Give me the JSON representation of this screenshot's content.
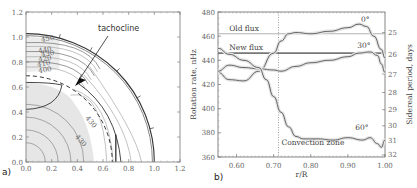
{
  "chart_data": [
    {
      "type": "contour",
      "panel_label": "a)",
      "title": "",
      "xlabel": "",
      "ylabel": "",
      "xlim": [
        0.0,
        1.2
      ],
      "ylim": [
        0.0,
        1.2
      ],
      "x_ticks": [
        "0.0",
        "0.2",
        "0.4",
        "0.6",
        "0.8",
        "1.0",
        "1.2"
      ],
      "y_ticks": [
        "0.0",
        "0.2",
        "0.4",
        "0.6",
        "0.8",
        "1.0",
        "1.2"
      ],
      "annotations": [
        {
          "text": "tachocline",
          "arrow_to": [
            0.38,
            0.6
          ]
        }
      ],
      "contour_labels": [
        "450",
        "440",
        "430",
        "420",
        "410",
        "400",
        "430",
        "430"
      ],
      "tachocline_radius": 0.7,
      "surface_radius": 1.0
    },
    {
      "type": "line",
      "panel_label": "b)",
      "title": "",
      "xlabel": "r/R",
      "ylabel": "Rotation rate, nHz",
      "ylabel_right": "Sidereal period, days",
      "xlim": [
        0.55,
        1.0
      ],
      "ylim": [
        360,
        480
      ],
      "x_ticks": [
        "0.60",
        "0.70",
        "0.80",
        "0.90",
        "1.00"
      ],
      "y_ticks": [
        "360",
        "380",
        "400",
        "420",
        "440",
        "460",
        "480"
      ],
      "y_ticks_right": [
        "24",
        "25",
        "26",
        "27",
        "28",
        "29",
        "30",
        "31",
        "32"
      ],
      "grid": false,
      "vertical_line": {
        "x": 0.713,
        "label": "Convection zone",
        "style": "dotted"
      },
      "horizontal_lines": [
        {
          "name": "Old flux",
          "y": 462
        },
        {
          "name": "New flux",
          "y": 446
        }
      ],
      "series": [
        {
          "name": "0°",
          "x": [
            0.55,
            0.58,
            0.62,
            0.66,
            0.7,
            0.72,
            0.74,
            0.76,
            0.8,
            0.85,
            0.9,
            0.93,
            0.95,
            0.97,
            0.99,
            1.0
          ],
          "y": [
            430,
            424,
            423,
            431,
            446,
            456,
            462,
            463,
            462,
            464,
            467,
            470,
            468,
            460,
            449,
            442
          ]
        },
        {
          "name": "30°",
          "x": [
            0.55,
            0.58,
            0.62,
            0.66,
            0.7,
            0.72,
            0.76,
            0.8,
            0.85,
            0.9,
            0.93,
            0.96,
            0.98,
            0.99,
            1.0
          ],
          "y": [
            431,
            436,
            434,
            433,
            432,
            431,
            435,
            438,
            440,
            443,
            446,
            447,
            444,
            437,
            430
          ]
        },
        {
          "name": "60°",
          "x": [
            0.55,
            0.58,
            0.62,
            0.66,
            0.68,
            0.7,
            0.72,
            0.74,
            0.76,
            0.78,
            0.82,
            0.86,
            0.9,
            0.94,
            0.96,
            0.98,
            0.99,
            1.0
          ],
          "y": [
            450,
            445,
            440,
            434,
            424,
            410,
            397,
            385,
            377,
            375,
            375,
            374,
            376,
            374,
            376,
            371,
            368,
            374
          ]
        }
      ],
      "series_labels": [
        "0°",
        "30°",
        "60°"
      ]
    }
  ]
}
